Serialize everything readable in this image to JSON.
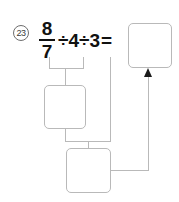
{
  "problem": {
    "number_label": "23",
    "equation": {
      "fraction_numerator": "8",
      "fraction_denominator": "7",
      "divide_symbol_1": "÷",
      "divisor_1": "4",
      "divide_symbol_2": "÷",
      "divisor_2": "3",
      "equals_symbol": "="
    }
  },
  "answer_boxes": {
    "result": {
      "value": "",
      "placeholder": ""
    },
    "step1": {
      "value": "",
      "placeholder": ""
    },
    "step2": {
      "value": "",
      "placeholder": ""
    }
  },
  "colors": {
    "box_border": "#b9b9b9",
    "connector_line": "#b9b9b9",
    "arrow_head": "#1a1a1a",
    "equation_text": "#111111",
    "number_badge": "#6e6e6e",
    "page_background": "#ffffff"
  }
}
